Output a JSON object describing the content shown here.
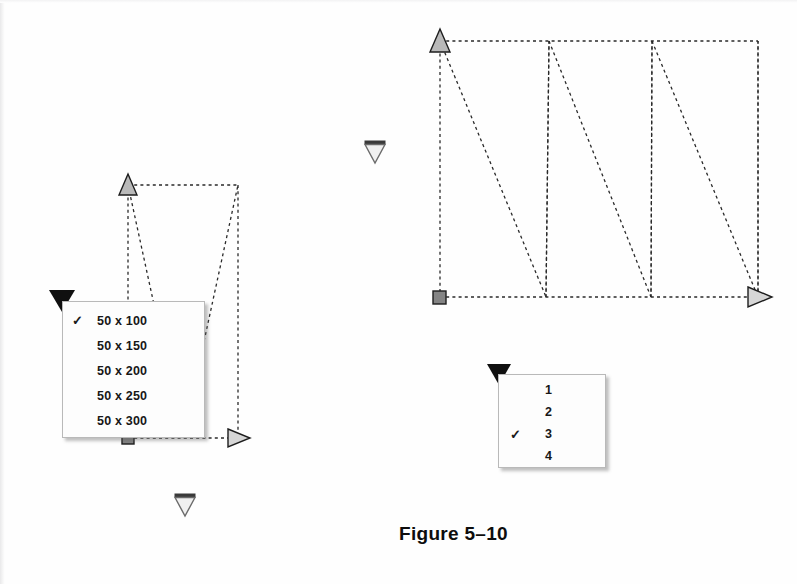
{
  "figure": {
    "caption": "Figure 5–10",
    "background_color": "#fefefe",
    "ink_color": "#1a1a1a"
  },
  "menus": [
    {
      "id": "size-menu",
      "name": "rect-size-dropdown",
      "trigger_icon": "triangle-down-icon",
      "selected_index": 0,
      "check_glyph": "✓",
      "items": [
        {
          "label": "50 x 100",
          "checked": true
        },
        {
          "label": "50 x 150",
          "checked": false
        },
        {
          "label": "50 x 200",
          "checked": false
        },
        {
          "label": "50 x 250",
          "checked": false
        },
        {
          "label": "50 x 300",
          "checked": false
        }
      ]
    },
    {
      "id": "count-menu",
      "name": "zigzag-count-dropdown",
      "trigger_icon": "triangle-down-icon",
      "selected_index": 2,
      "check_glyph": "✓",
      "items": [
        {
          "label": "1",
          "checked": false
        },
        {
          "label": "2",
          "checked": false
        },
        {
          "label": "3",
          "checked": true
        },
        {
          "label": "4",
          "checked": false
        }
      ]
    }
  ],
  "diagrams": [
    {
      "id": "left-diagram",
      "name": "zigzag-path-small",
      "periods": 1,
      "rect": {
        "x": 128,
        "y": 185,
        "width": 110,
        "height": 253
      },
      "start_node": {
        "icon": "square-marker",
        "x": 128,
        "y": 438
      },
      "end_node": {
        "icon": "triangle-right-marker",
        "x": 238,
        "y": 438
      },
      "top_node": {
        "icon": "triangle-up-marker",
        "x": 128,
        "y": 185
      },
      "apex_bottom": {
        "x": 183,
        "y": 438
      }
    },
    {
      "id": "right-diagram",
      "name": "zigzag-path-large",
      "periods": 3,
      "rect": {
        "x": 440,
        "y": 41,
        "width": 318,
        "height": 256
      },
      "start_node": {
        "icon": "square-marker",
        "x": 440,
        "y": 297
      },
      "end_node": {
        "icon": "triangle-right-marker",
        "x": 758,
        "y": 297
      },
      "top_node": {
        "icon": "triangle-up-marker",
        "x": 440,
        "y": 41
      },
      "apexes_top": [
        549,
        652
      ],
      "apexes_bottom": [
        546,
        651
      ]
    }
  ],
  "loose_markers": [
    {
      "name": "triangle-down-marker-a",
      "icon": "triangle-down-outline-icon",
      "x": 374,
      "y": 147
    },
    {
      "name": "triangle-down-marker-b",
      "icon": "triangle-down-outline-icon",
      "x": 184,
      "y": 500
    }
  ]
}
